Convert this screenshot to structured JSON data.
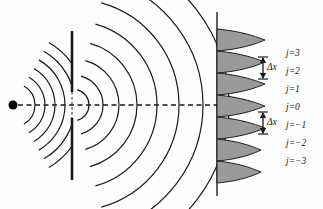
{
  "figure": {
    "background_color": "#fdfdfd",
    "stroke_color": "#1a1a1a",
    "fringe_fill_color": "#9a9a9a",
    "width": 323,
    "height": 209
  },
  "source": {
    "name": "point-source",
    "x": 13,
    "y": 105,
    "radius": 4.5,
    "color": "#000000"
  },
  "axis": {
    "name": "optical-axis",
    "style": "dashed",
    "x_start": 18,
    "x_end": 218,
    "y": 105
  },
  "barrier": {
    "name": "slit-barrier",
    "x": 72,
    "y_top": 31,
    "y_bottom": 180,
    "slit_y_top": 92,
    "slit_y_bottom": 118,
    "thickness": 2.6
  },
  "screen": {
    "name": "detection-screen",
    "x": 217,
    "y_top": 12,
    "y_bottom": 196,
    "thickness": 1.4
  },
  "incident_waves": {
    "name": "incident-spherical-wavefronts",
    "center_x": 13,
    "center_y": 105,
    "radii": [
      22,
      32,
      42,
      52,
      62,
      72
    ]
  },
  "diffracted_waves": {
    "name": "diffracted-wavefronts",
    "center_x": 73,
    "center_y": 105,
    "radii": [
      16,
      30,
      46,
      64,
      84,
      106,
      130,
      156
    ]
  },
  "fringes": {
    "name": "intensity-fringe-pattern",
    "baseline_x": 217,
    "peak_length": 48,
    "half_width": 11,
    "peaks": [
      {
        "order": "j=3",
        "y": 40,
        "amplitude": 1.0
      },
      {
        "order": "j=2",
        "y": 62,
        "amplitude": 1.0
      },
      {
        "order": "j=1",
        "y": 84,
        "amplitude": 1.0
      },
      {
        "order": "j=0",
        "y": 106,
        "amplitude": 1.0
      },
      {
        "order": "j=-1",
        "y": 128,
        "amplitude": 1.0
      },
      {
        "order": "j=-2",
        "y": 150,
        "amplitude": 0.92
      },
      {
        "order": "j=-3",
        "y": 172,
        "amplitude": 0.92
      }
    ]
  },
  "order_labels": [
    {
      "name": "order-label-j3",
      "text": "j=3",
      "x": 286,
      "y": 49
    },
    {
      "name": "order-label-j2",
      "text": "j=2",
      "x": 286,
      "y": 67
    },
    {
      "name": "order-label-j1",
      "text": "j=1",
      "x": 286,
      "y": 85
    },
    {
      "name": "order-label-j0",
      "text": "j=0",
      "x": 286,
      "y": 103
    },
    {
      "name": "order-label-jm1",
      "text": "j=−1",
      "x": 286,
      "y": 121
    },
    {
      "name": "order-label-jm2",
      "text": "j=−2",
      "x": 286,
      "y": 139
    },
    {
      "name": "order-label-jm3",
      "text": "j=−3",
      "x": 286,
      "y": 157
    }
  ],
  "spacing_annotations": [
    {
      "name": "fringe-spacing-upper",
      "label": "Δx",
      "arrow_x": 263,
      "y_top": 57,
      "y_bottom": 79,
      "label_x": 267,
      "label_y": 63
    },
    {
      "name": "fringe-spacing-lower",
      "label": "Δx",
      "arrow_x": 263,
      "y_top": 112,
      "y_bottom": 134,
      "label_x": 267,
      "label_y": 118
    }
  ]
}
